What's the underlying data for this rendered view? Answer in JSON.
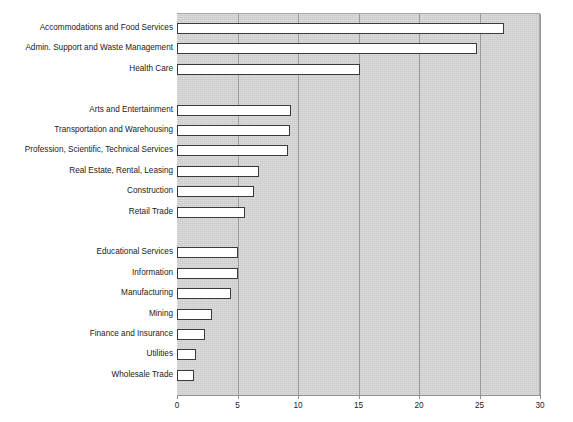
{
  "chart_data": {
    "type": "bar",
    "orientation": "horizontal",
    "title": "",
    "xlabel": "",
    "ylabel": "",
    "xlim": [
      0,
      30
    ],
    "xticks": [
      0,
      5,
      10,
      15,
      20,
      25,
      30
    ],
    "grid": true,
    "gridlines_axis": "x",
    "legend": false,
    "plot_background_color": "#d2d2d2",
    "bar_fill_color": "#ffffff",
    "bar_edge_color": "#3a3a3a",
    "categories": [
      "Accommodations and Food Services",
      "Admin. Support and Waste Management",
      "Health Care",
      "Arts and Entertainment",
      "Transportation and Warehousing",
      "Profession, Scientific, Technical Services",
      "Real Estate, Rental, Leasing",
      "Construction",
      "Retail Trade",
      "Educational Services",
      "Information",
      "Manufacturing",
      "Mining",
      "Finance and Insurance",
      "Utilities",
      "Wholesale Trade"
    ],
    "values": [
      27.0,
      24.8,
      15.1,
      9.4,
      9.3,
      9.2,
      6.8,
      6.4,
      5.6,
      5.0,
      5.0,
      4.5,
      2.9,
      2.3,
      1.6,
      1.4
    ],
    "groups": [
      {
        "name": "group-1",
        "categories": [
          "Accommodations and Food Services",
          "Admin. Support and Waste Management",
          "Health Care"
        ]
      },
      {
        "name": "group-2",
        "categories": [
          "Arts and Entertainment",
          "Transportation and Warehousing",
          "Profession, Scientific, Technical Services",
          "Real Estate, Rental, Leasing",
          "Construction",
          "Retail Trade"
        ]
      },
      {
        "name": "group-3",
        "categories": [
          "Educational Services",
          "Information",
          "Manufacturing",
          "Mining",
          "Finance and Insurance",
          "Utilities",
          "Wholesale Trade"
        ]
      }
    ]
  }
}
